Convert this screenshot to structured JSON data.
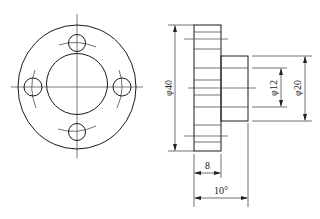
{
  "drawing": {
    "front_view": {
      "center": [
        77,
        87
      ],
      "outer_radius": 61,
      "inner_radius": 31,
      "hole_radius": 8.5,
      "holes": [
        [
          77,
          43
        ],
        [
          77,
          132
        ],
        [
          33,
          87
        ],
        [
          122,
          87
        ]
      ]
    },
    "side_view": {
      "flange": {
        "x": 194,
        "y": 25,
        "w": 27,
        "h": 126
      },
      "hub": {
        "x": 221,
        "y": 56,
        "w": 27,
        "h": 65
      }
    },
    "dimensions": {
      "outer_diameter": "φ40",
      "bore_diameter": "φ12",
      "hub_diameter": "φ20",
      "flange_thickness": "8",
      "total_length": "10°"
    }
  }
}
